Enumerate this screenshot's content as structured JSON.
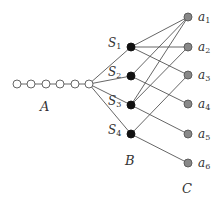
{
  "diagram": {
    "type": "graph",
    "colors": {
      "edge": "#555555",
      "hollow_fill": "#ffffff",
      "hollow_stroke": "#555555",
      "b_fill": "#111111",
      "c_fill": "#888888",
      "c_stroke": "#555555"
    },
    "groups": {
      "A": {
        "label": "A"
      },
      "B": {
        "label": "B"
      },
      "C": {
        "label": "C"
      }
    },
    "path_nodes": [
      {
        "id": "p1",
        "x": 17,
        "y": 84
      },
      {
        "id": "p2",
        "x": 31,
        "y": 84
      },
      {
        "id": "p3",
        "x": 46,
        "y": 84
      },
      {
        "id": "p4",
        "x": 60,
        "y": 84
      },
      {
        "id": "p5",
        "x": 75,
        "y": 84
      },
      {
        "id": "hub",
        "x": 89,
        "y": 84
      }
    ],
    "b_nodes": [
      {
        "id": "S1",
        "label": "S",
        "sub": "1",
        "x": 131,
        "y": 47
      },
      {
        "id": "S2",
        "label": "S",
        "sub": "2",
        "x": 131,
        "y": 76
      },
      {
        "id": "S3",
        "label": "S",
        "sub": "3",
        "x": 131,
        "y": 105
      },
      {
        "id": "S4",
        "label": "S",
        "sub": "4",
        "x": 131,
        "y": 134
      }
    ],
    "c_nodes": [
      {
        "id": "a1",
        "label": "a",
        "sub": "1",
        "x": 188,
        "y": 17
      },
      {
        "id": "a2",
        "label": "a",
        "sub": "2",
        "x": 188,
        "y": 47
      },
      {
        "id": "a3",
        "label": "a",
        "sub": "3",
        "x": 188,
        "y": 75
      },
      {
        "id": "a4",
        "label": "a",
        "sub": "4",
        "x": 188,
        "y": 104
      },
      {
        "id": "a5",
        "label": "a",
        "sub": "5",
        "x": 188,
        "y": 134
      },
      {
        "id": "a6",
        "label": "a",
        "sub": "6",
        "x": 188,
        "y": 163
      }
    ],
    "edges": [
      [
        "p1",
        "p2"
      ],
      [
        "p2",
        "p3"
      ],
      [
        "p3",
        "p4"
      ],
      [
        "p4",
        "p5"
      ],
      [
        "p5",
        "hub"
      ],
      [
        "hub",
        "S1"
      ],
      [
        "hub",
        "S2"
      ],
      [
        "hub",
        "S3"
      ],
      [
        "hub",
        "S4"
      ],
      [
        "S1",
        "a1"
      ],
      [
        "S1",
        "a2"
      ],
      [
        "S1",
        "a3"
      ],
      [
        "S2",
        "a1"
      ],
      [
        "S2",
        "a4"
      ],
      [
        "S3",
        "a1"
      ],
      [
        "S3",
        "a2"
      ],
      [
        "S3",
        "a5"
      ],
      [
        "S4",
        "a3"
      ],
      [
        "S4",
        "a6"
      ]
    ]
  }
}
